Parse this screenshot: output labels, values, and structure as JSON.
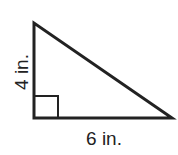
{
  "diagram": {
    "type": "right-triangle",
    "height_label": "4 in.",
    "base_label": "6 in.",
    "right_angle_marker": true,
    "stroke_color": "#222222"
  }
}
